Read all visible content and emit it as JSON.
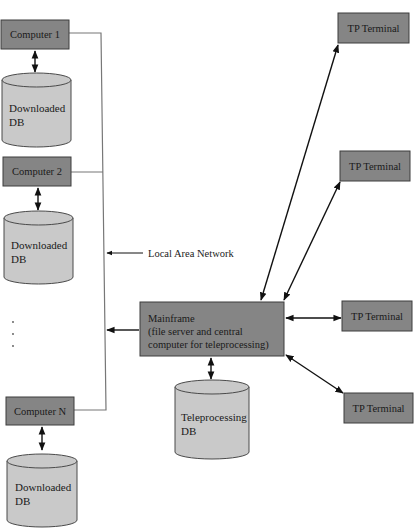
{
  "diagram": {
    "computers": [
      {
        "label": "Computer 1",
        "db_line1": "Downloaded",
        "db_line2": "DB"
      },
      {
        "label": "Computer 2",
        "db_line1": "Downloaded",
        "db_line2": "DB"
      },
      {
        "label": "Computer N",
        "db_line1": "Downloaded",
        "db_line2": "DB"
      }
    ],
    "ellipsis": "⋮",
    "lan_label": "Local Area Network",
    "mainframe": {
      "line1": "Mainframe",
      "line2": "(file server and central",
      "line3": "computer for teleprocessing)"
    },
    "teleprocessing_db": {
      "line1": "Teleprocessing",
      "line2": "DB"
    },
    "terminals": [
      {
        "label": "TP Terminal"
      },
      {
        "label": "TP Terminal"
      },
      {
        "label": "TP Terminal"
      },
      {
        "label": "TP Terminal"
      }
    ],
    "colors": {
      "box_fill": "#858585",
      "db_fill": "#c9c9c9",
      "line": "#777777",
      "arrow": "#111111"
    }
  }
}
